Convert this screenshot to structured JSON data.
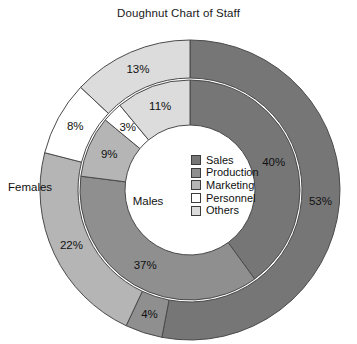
{
  "chart": {
    "title": "Doughnut Chart of Staff"
  },
  "legend": {
    "items": [
      {
        "label": "Sales",
        "color": "#767676",
        "swatch_name": "legend-swatch-sales"
      },
      {
        "label": "Production",
        "color": "#8f8f8f",
        "swatch_name": "legend-swatch-production"
      },
      {
        "label": "Marketing",
        "color": "#b5b5b5",
        "swatch_name": "legend-swatch-marketing"
      },
      {
        "label": "Personnel",
        "color": "#ffffff",
        "swatch_name": "legend-swatch-personnel"
      },
      {
        "label": "Others",
        "color": "#dcdcdc",
        "swatch_name": "legend-swatch-others"
      }
    ]
  },
  "ring_names": {
    "outer": "Females",
    "inner": "Males"
  },
  "chart_data": {
    "type": "pie",
    "title": "Doughnut Chart of Staff",
    "subtype": "doughnut",
    "legend_position": "center-right",
    "grid": false,
    "categories": [
      "Sales",
      "Production",
      "Marketing",
      "Personnel",
      "Others"
    ],
    "colors": [
      "#767676",
      "#8f8f8f",
      "#b5b5b5",
      "#ffffff",
      "#dcdcdc"
    ],
    "series": [
      {
        "name": "Males",
        "ring": "inner",
        "values": [
          40,
          37,
          9,
          3,
          11
        ],
        "labels": [
          "40%",
          "37%",
          "9%",
          "3%",
          "11%"
        ]
      },
      {
        "name": "Females",
        "ring": "outer",
        "values": [
          53,
          4,
          22,
          8,
          13
        ],
        "labels": [
          "53%",
          "4%",
          "22%",
          "8%",
          "13%"
        ]
      }
    ],
    "annotations": [
      "Females",
      "Males"
    ],
    "xlabel": "",
    "ylabel": ""
  },
  "geometry": {
    "cx": 190,
    "cy": 190,
    "outer_r_out": 150,
    "outer_r_in": 112,
    "inner_r_out": 110,
    "inner_r_in": 65,
    "start_angle_deg": -90,
    "direction": "clockwise"
  }
}
